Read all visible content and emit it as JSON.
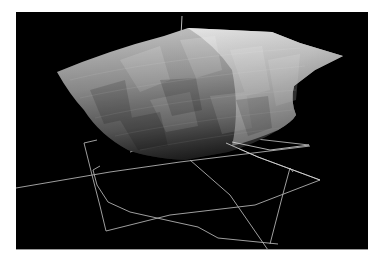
{
  "scene": {
    "description": "3D rendered grayscale shaded surface with wireframe floor outline",
    "background_color": "#000000",
    "frame_color": "#ffffff",
    "surface": {
      "shading": "grayscale faceted",
      "highlight_color": "#f2f2f2",
      "shadow_color": "#2a2a2a"
    },
    "wireframe": {
      "line_color": "#cfcfcf"
    },
    "vertical_axis": {
      "color": "#bbbbbb"
    }
  }
}
